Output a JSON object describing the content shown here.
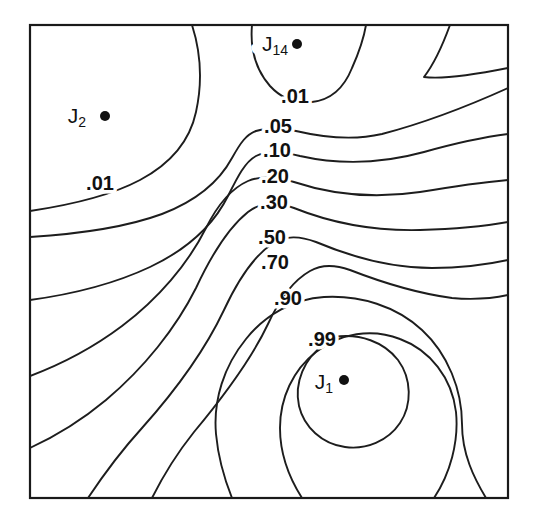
{
  "figure": {
    "name": "contour-plot",
    "background_color": "#ffffff",
    "line_color": "#1d1d1d",
    "frame_color": "#1a1a1a",
    "frame": {
      "x": 30,
      "y": 25,
      "width": 478,
      "height": 473
    }
  },
  "chart_data": {
    "type": "contour",
    "title": "",
    "subtitle": "",
    "xlabel": "",
    "ylabel": "",
    "grid": false,
    "legend": "none",
    "axis_ticks": false,
    "axis_tick_labels": [],
    "xlim": [
      0,
      1
    ],
    "ylim": [
      0,
      1
    ],
    "levels": [
      0.01,
      0.05,
      0.1,
      0.2,
      0.3,
      0.5,
      0.7,
      0.9,
      0.99
    ],
    "level_labels": [
      ".01",
      ".05",
      ".10",
      ".20",
      ".30",
      ".50",
      ".70",
      ".90",
      ".99"
    ],
    "maximum_at": "J_1",
    "minima_at": [
      "J_2",
      "J_14"
    ],
    "points": [
      {
        "id": "J_1",
        "base": "J",
        "subscript": "1",
        "value": 1.0,
        "px": {
          "x": 345,
          "y": 381
        },
        "dot_px": {
          "x": 344,
          "y": 380
        },
        "label_px": {
          "x": 333,
          "y": 383
        }
      },
      {
        "id": "J_2",
        "base": "J",
        "subscript": "2",
        "value": 0.0,
        "px": {
          "x": 105,
          "y": 117
        },
        "dot_px": {
          "x": 105,
          "y": 116
        },
        "label_px": {
          "x": 86,
          "y": 117
        }
      },
      {
        "id": "J_14",
        "base": "J",
        "subscript": "14",
        "value": 0.0,
        "px": {
          "x": 297,
          "y": 44
        },
        "dot_px": {
          "x": 297,
          "y": 44
        },
        "label_px": {
          "x": 288,
          "y": 45
        }
      }
    ],
    "contour_labels": [
      {
        "text": ".01",
        "level": 0.01,
        "px": {
          "x": 295,
          "y": 98
        }
      },
      {
        "text": ".01",
        "level": 0.01,
        "px": {
          "x": 100,
          "y": 185
        }
      },
      {
        "text": ".05",
        "level": 0.05,
        "px": {
          "x": 278,
          "y": 128
        }
      },
      {
        "text": ".10",
        "level": 0.1,
        "px": {
          "x": 277,
          "y": 152
        }
      },
      {
        "text": ".20",
        "level": 0.2,
        "px": {
          "x": 275,
          "y": 178
        }
      },
      {
        "text": ".30",
        "level": 0.3,
        "px": {
          "x": 274,
          "y": 204
        }
      },
      {
        "text": ".50",
        "level": 0.5,
        "px": {
          "x": 272,
          "y": 239
        }
      },
      {
        "text": ".70",
        "level": 0.7,
        "px": {
          "x": 275,
          "y": 264
        }
      },
      {
        "text": ".90",
        "level": 0.9,
        "px": {
          "x": 288,
          "y": 300
        }
      },
      {
        "text": ".99",
        "level": 0.99,
        "px": {
          "x": 322,
          "y": 341
        }
      }
    ],
    "contour_paths": [
      {
        "level": 0.01,
        "name": "contour-001-upperleft",
        "d": "M 30 211 C 70 205 110 196 140 180 C 172 163 190 140 196 112 C 203 80 200 50 192 25"
      },
      {
        "level": 0.01,
        "name": "contour-001-j14",
        "d": "M 252 25 C 250 48 256 70 270 86 C 282 99 296 104 312 102 C 330 100 344 88 352 68 C 360 50 364 37 366 25"
      },
      {
        "level": 0.01,
        "name": "contour-001-upperright",
        "d": "M 450 25 C 442 47 434 64 424 77 C 440 79 468 76 508 68"
      },
      {
        "level": 0.05,
        "name": "contour-005",
        "d": "M 30 237 C 78 234 124 228 162 214 C 196 201 219 182 232 158 C 241 142 246 135 256 131 C 268 127 282 128 296 131 C 330 139 356 140 382 134 C 420 124 466 107 508 88"
      },
      {
        "level": 0.1,
        "name": "contour-010",
        "d": "M 30 300 C 74 294 116 283 150 267 C 188 249 214 224 228 196 C 238 176 245 162 256 156 C 268 150 284 152 300 156 C 340 165 384 163 424 152 C 456 143 484 137 508 134"
      },
      {
        "level": 0.2,
        "name": "contour-020",
        "d": "M 30 376 C 62 364 94 347 122 326 C 158 299 188 264 206 228 C 218 204 232 188 248 181 C 262 175 278 177 294 182 C 336 196 380 198 420 192 C 456 186 486 182 508 180"
      },
      {
        "level": 0.3,
        "name": "contour-030",
        "d": "M 30 448 C 56 436 82 420 106 400 C 144 368 176 328 196 288 C 210 258 228 228 248 212 C 262 201 278 202 294 208 C 334 224 378 231 420 230 C 456 229 486 226 508 222"
      },
      {
        "level": 0.5,
        "name": "contour-050",
        "d": "M 88 498 C 104 474 122 450 142 428 C 176 390 206 348 224 310 C 238 280 254 256 272 244 C 286 235 300 236 316 242 C 354 258 394 268 432 268 C 462 268 490 264 508 260"
      },
      {
        "level": 0.7,
        "name": "contour-070",
        "d": "M 152 498 C 164 474 178 452 194 432 C 224 396 252 358 268 324 C 280 298 294 280 310 271 C 322 264 336 265 350 270 C 386 284 422 294 452 298 C 474 300 494 298 508 295"
      },
      {
        "level": 0.9,
        "name": "contour-090",
        "d": "M 232 498 C 224 478 218 456 216 434 C 213 400 224 366 246 339 C 266 314 294 299 324 297 C 360 295 396 306 422 330 C 448 354 462 390 462 424 C 462 454 474 478 486 498"
      },
      {
        "level": 0.99,
        "name": "contour-099",
        "d": "M 334 337 C 360 333 384 342 398 360 C 412 379 412 405 400 423 C 388 441 366 450 345 447 C 322 444 304 427 299 406 C 294 383 304 358 325 344 C 328 342 331 340 334 337"
      },
      {
        "level": 0.95,
        "name": "contour-095-outer",
        "d": "M 302 498 C 288 476 280 452 280 428 C 280 398 293 370 316 352 C 340 333 372 328 400 339 C 430 350 452 378 456 412 C 459 442 450 474 434 498"
      }
    ]
  }
}
